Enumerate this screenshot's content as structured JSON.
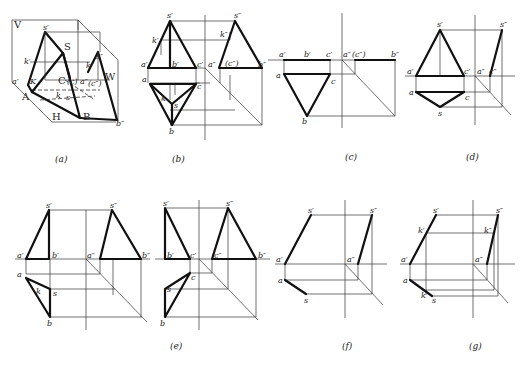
{
  "figure": {
    "type": "descriptive-geometry projections of triangular pyramid S-ABC",
    "panels": [
      {
        "id": "a",
        "caption": "(a)",
        "kind": "pictorial",
        "labels": {
          "V": "V",
          "W": "W",
          "H": "H",
          "S": "S",
          "s1": "s′",
          "s3": "s″",
          "k1": "k′",
          "K": "K",
          "k3": "k″",
          "a1": "a′",
          "A": "A",
          "C": "C",
          "c": "(c)",
          "a3": "a″",
          "c3": "(c″)",
          "B": "B",
          "b3": "b″",
          "k": "k",
          "s": "s"
        }
      },
      {
        "id": "b",
        "caption": "(b)",
        "kind": "three-view",
        "labels": {
          "s1": "s′",
          "s3": "s″",
          "k1": "k′",
          "k3": "k″",
          "a1": "a′",
          "b1": "b′",
          "c1": "c′",
          "a3": "a″",
          "c3": "(c″)",
          "b3": "b″",
          "a": "a",
          "c": "c",
          "k": "k",
          "s": "s",
          "b": "b"
        }
      },
      {
        "id": "c",
        "caption": "(c)",
        "kind": "three-view-base",
        "labels": {
          "a1": "a′",
          "b1": "b′",
          "c1": "c′",
          "a3": "a″",
          "c3": "(c″)",
          "b3": "b″",
          "a": "a",
          "c": "c",
          "b": "b"
        }
      },
      {
        "id": "d",
        "caption": "(d)",
        "kind": "three-view-face-SAC",
        "labels": {
          "s1": "s′",
          "s3": "s″",
          "a1": "a′",
          "c1": "c′",
          "a3": "a″",
          "c3": "c″",
          "a": "a",
          "c": "c",
          "s": "s"
        }
      },
      {
        "id": "e1",
        "caption": "",
        "kind": "three-view-face-SAB",
        "labels": {
          "s1": "s′",
          "s3": "s″",
          "a1": "a′",
          "b1": "b′",
          "a3": "a″",
          "b3": "b″",
          "a": "a",
          "k": "k",
          "s": "s",
          "b": "b"
        }
      },
      {
        "id": "e2",
        "caption": "(e)",
        "kind": "three-view-face-SBC",
        "labels": {
          "s1": "s′",
          "s3": "s″",
          "b1": "b′",
          "c1": "c′",
          "c3": "c″",
          "b3": "b″",
          "c": "c",
          "s": "s",
          "b": "b"
        }
      },
      {
        "id": "f",
        "caption": "(f)",
        "kind": "three-view-edge-SA",
        "labels": {
          "s1": "s′",
          "s3": "s″",
          "a1": "a′",
          "a3": "a″",
          "a": "a",
          "s": "s"
        }
      },
      {
        "id": "g",
        "caption": "(g)",
        "kind": "three-view-edge-SA-with-K",
        "labels": {
          "s1": "s′",
          "s3": "s″",
          "k1": "k′",
          "k3": "k″",
          "a1": "a′",
          "a3": "a″",
          "a": "a",
          "k": "k",
          "s": "s"
        }
      }
    ]
  }
}
